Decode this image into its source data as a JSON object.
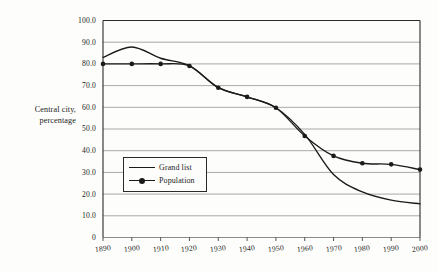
{
  "chart_data": {
    "type": "line",
    "title": "",
    "xlabel": "",
    "ylabel": "Central city, percentage",
    "ylabel_lines": [
      "Central city,",
      "percentage"
    ],
    "x": [
      1890,
      1900,
      1910,
      1920,
      1930,
      1940,
      1950,
      1960,
      1970,
      1980,
      1990,
      2000
    ],
    "categories": [
      "1890",
      "1900",
      "1910",
      "1920",
      "1930",
      "1940",
      "1950",
      "1960",
      "1970",
      "1980",
      "1990",
      "2000"
    ],
    "xlim": [
      1890,
      2000
    ],
    "ylim": [
      0,
      100
    ],
    "yticks": [
      100.0,
      90.0,
      80.0,
      70.0,
      60.0,
      50.0,
      40.0,
      30.0,
      20.0,
      10.0,
      0
    ],
    "ytick_labels": [
      "100.0",
      "90.0",
      "80.0",
      "70.0",
      "60.0",
      "50.0",
      "40.0",
      "30.0",
      "20.0",
      "10.0",
      "0"
    ],
    "xtick_labels": [
      "1890",
      "1900",
      "1910",
      "1920",
      "1930",
      "1940",
      "1950",
      "1960",
      "1970",
      "1980",
      "1990",
      "2000"
    ],
    "grid": "horizontal",
    "legend_position": "inside-left",
    "series": [
      {
        "name": "Grand list",
        "markers": false,
        "values": [
          83.0,
          87.8,
          82.6,
          79.2,
          69.2,
          64.8,
          59.8,
          47.5,
          29.0,
          21.0,
          17.2,
          15.5
        ]
      },
      {
        "name": "Population",
        "markers": true,
        "values": [
          80.0,
          80.0,
          80.0,
          79.0,
          69.0,
          64.8,
          59.8,
          46.8,
          37.6,
          34.2,
          33.7,
          31.3
        ]
      }
    ]
  },
  "legend": {
    "items": [
      {
        "label": "Grand list"
      },
      {
        "label": "Population"
      }
    ]
  },
  "colors": {
    "line": "#1b1b1b",
    "grid": "#8c8c8c",
    "frame": "#2a2a2a",
    "background": "#fdfdfb",
    "text": "#1b1b1b"
  }
}
